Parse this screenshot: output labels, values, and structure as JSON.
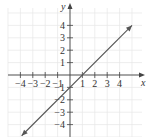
{
  "chart_data": {
    "type": "line",
    "title": "",
    "xlabel": "x",
    "ylabel": "y",
    "xlim": [
      -5,
      5
    ],
    "ylim": [
      -5,
      5
    ],
    "grid": true,
    "x_ticks": [
      -4,
      -3,
      -2,
      -1,
      1,
      2,
      3,
      4
    ],
    "y_ticks": [
      4,
      3,
      2,
      1,
      -1,
      -2,
      -3,
      -4
    ],
    "x_tick_labels": [
      "−4",
      "−3",
      "−2",
      "−1",
      "1",
      "2",
      "3",
      "4"
    ],
    "y_tick_labels": [
      "4",
      "3",
      "2",
      "1",
      "−1",
      "−2",
      "−3",
      "−4"
    ],
    "series": [
      {
        "name": "y = x - 1",
        "x": [
          -4,
          -3,
          -2,
          -1,
          0,
          1,
          2,
          3,
          4,
          5
        ],
        "values": [
          -5,
          -4,
          -3,
          -2,
          -1,
          0,
          1,
          2,
          3,
          4
        ],
        "arrows": "both",
        "color": "#555555"
      }
    ]
  },
  "labels": {
    "x": "x",
    "y": "y"
  }
}
